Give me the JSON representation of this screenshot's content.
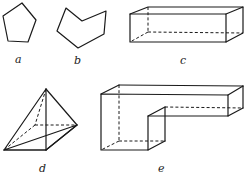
{
  "figure": {
    "shapes": [
      {
        "id": "a",
        "label": "a",
        "kind": "pentagon"
      },
      {
        "id": "b",
        "label": "b",
        "kind": "hexagon-concave"
      },
      {
        "id": "c",
        "label": "c",
        "kind": "rectangular-prism"
      },
      {
        "id": "d",
        "label": "d",
        "kind": "square-pyramid"
      },
      {
        "id": "e",
        "label": "e",
        "kind": "l-shaped-prism"
      }
    ],
    "colors": {
      "line": "#1a1a1a",
      "background": "#ffffff"
    }
  }
}
